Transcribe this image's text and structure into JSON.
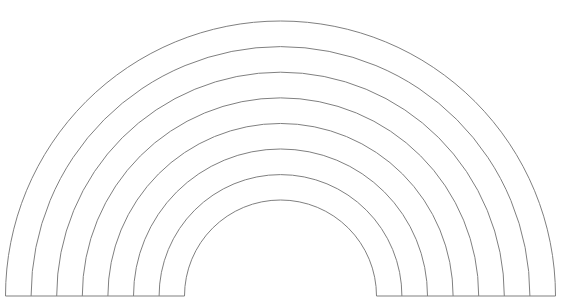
{
  "figure": {
    "background_color": "#ffffff",
    "stroke_color": "#808080",
    "stroke_width": 1,
    "canvas": {
      "width": 562,
      "height": 304
    }
  },
  "geometry": {
    "center_x": 280.5,
    "center_y": 296,
    "baseline_y": 296,
    "arc_count": 8,
    "band_width": 25.6,
    "inner_radius": 96,
    "outer_radius": 275,
    "radii": [
      275,
      249.4,
      223.8,
      198.2,
      172.6,
      147,
      121.4,
      96
    ],
    "apex_y": [
      21,
      46.6,
      72.2,
      97.8,
      123.4,
      149,
      174.6,
      200
    ],
    "left_feet_x": [
      5.5,
      31.1,
      56.7,
      82.3,
      107.9,
      133.5,
      159.1,
      184.5
    ],
    "right_feet_x": [
      555.5,
      529.9,
      504.3,
      478.7,
      453.1,
      427.5,
      401.9,
      376.5
    ]
  },
  "arcs": [
    {
      "index": 1,
      "name": "arc-outer-1",
      "radius": 275,
      "apex_y": 21,
      "left_foot_x": 5.5,
      "right_foot_x": 555.5
    },
    {
      "index": 2,
      "name": "arc-2",
      "radius": 249.4,
      "apex_y": 46.6,
      "left_foot_x": 31.1,
      "right_foot_x": 529.9
    },
    {
      "index": 3,
      "name": "arc-3",
      "radius": 223.8,
      "apex_y": 72.2,
      "left_foot_x": 56.7,
      "right_foot_x": 504.3
    },
    {
      "index": 4,
      "name": "arc-4",
      "radius": 198.2,
      "apex_y": 97.8,
      "left_foot_x": 82.3,
      "right_foot_x": 478.7
    },
    {
      "index": 5,
      "name": "arc-5",
      "radius": 172.6,
      "apex_y": 123.4,
      "left_foot_x": 107.9,
      "right_foot_x": 453.1
    },
    {
      "index": 6,
      "name": "arc-6",
      "radius": 147,
      "apex_y": 149,
      "left_foot_x": 133.5,
      "right_foot_x": 427.5
    },
    {
      "index": 7,
      "name": "arc-7",
      "radius": 121.4,
      "apex_y": 174.6,
      "left_foot_x": 159.1,
      "right_foot_x": 401.9
    },
    {
      "index": 8,
      "name": "arc-inner-8",
      "radius": 96,
      "apex_y": 200,
      "left_foot_x": 184.5,
      "right_foot_x": 376.5
    }
  ],
  "baselines": [
    {
      "name": "baseline-left",
      "x1": 5.5,
      "x2": 184.5,
      "y": 296
    },
    {
      "name": "baseline-right",
      "x1": 376.5,
      "x2": 555.5,
      "y": 296
    }
  ]
}
